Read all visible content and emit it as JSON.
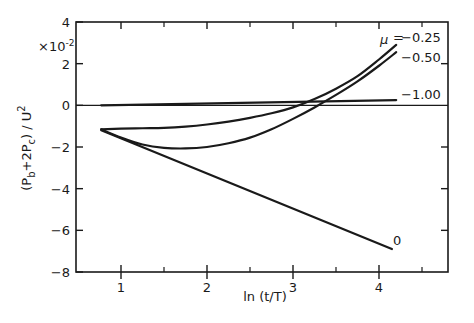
{
  "chart_data": {
    "type": "line",
    "title": "",
    "xlabel": "ln (t/T)",
    "ylabel": "(P_b + 2P_c) / U^2",
    "ylabel_parts": {
      "open": "(P",
      "sub1": "b",
      "mid": "+2P",
      "sub2": "c",
      "close": ") / U",
      "sup": "2"
    },
    "y_multiplier": "×10⁻²",
    "y_multiplier_parts": {
      "base": "×10",
      "exp": "-2"
    },
    "xlim": [
      0.35,
      4.8
    ],
    "ylim": [
      -8,
      4
    ],
    "xticks": [
      1,
      2,
      3,
      4
    ],
    "xtick_labels": [
      "1",
      "2",
      "3",
      "4"
    ],
    "x_minor_ticks": [
      1.5,
      2.5,
      3.5,
      4.5
    ],
    "yticks": [
      4,
      2,
      0,
      -2,
      -4,
      -6,
      -8
    ],
    "ytick_labels": [
      "4",
      "2",
      "0",
      "−2",
      "−4",
      "−6",
      "−8"
    ],
    "grid": false,
    "zero_line": true,
    "legend_position": "inline labels at right end of curves",
    "legend_title": "μ",
    "series": [
      {
        "name": "μ = -0.25",
        "label": "μ = −0.25",
        "x": [
          0.77,
          1.0,
          1.25,
          1.5,
          1.75,
          2.0,
          2.25,
          2.5,
          2.75,
          3.0,
          3.25,
          3.5,
          3.75,
          4.0,
          4.2
        ],
        "y": [
          -1.15,
          -1.12,
          -1.1,
          -1.08,
          -1.02,
          -0.92,
          -0.78,
          -0.6,
          -0.38,
          -0.1,
          0.3,
          0.8,
          1.4,
          2.2,
          2.9
        ]
      },
      {
        "name": "μ = -0.50",
        "label": "−0.50",
        "x": [
          0.77,
          1.0,
          1.25,
          1.5,
          1.75,
          2.0,
          2.25,
          2.5,
          2.75,
          3.0,
          3.25,
          3.5,
          3.75,
          4.0,
          4.2
        ],
        "y": [
          -1.15,
          -1.55,
          -1.88,
          -2.04,
          -2.07,
          -2.0,
          -1.82,
          -1.55,
          -1.15,
          -0.65,
          -0.1,
          0.5,
          1.15,
          1.9,
          2.55
        ]
      },
      {
        "name": "μ = -1.00",
        "label": "−1.00",
        "x": [
          0.77,
          4.2
        ],
        "y": [
          0.0,
          0.25
        ]
      },
      {
        "name": "μ = 0",
        "label": "0",
        "x": [
          0.77,
          4.15
        ],
        "y": [
          -1.2,
          -6.9
        ]
      }
    ]
  }
}
